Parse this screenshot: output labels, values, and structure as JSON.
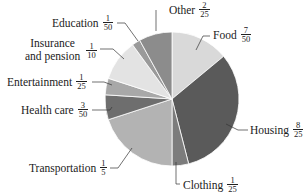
{
  "chart_data": {
    "type": "pie",
    "title": "",
    "start_angle_deg": 0,
    "direction": "clockwise",
    "slices": [
      {
        "label": "Food",
        "fraction": "7/50",
        "value": 0.14,
        "color": "#d9d9d9"
      },
      {
        "label": "Housing",
        "fraction": "8/25",
        "value": 0.32,
        "color": "#5a5a5a"
      },
      {
        "label": "Clothing",
        "fraction": "1/25",
        "value": 0.04,
        "color": "#7c7c7c"
      },
      {
        "label": "Transportation",
        "fraction": "1/5",
        "value": 0.2,
        "color": "#b3b3b3"
      },
      {
        "label": "Health care",
        "fraction": "3/50",
        "value": 0.06,
        "color": "#6e6e6e"
      },
      {
        "label": "Entertainment",
        "fraction": "1/25",
        "value": 0.04,
        "color": "#a8a8a8"
      },
      {
        "label": "Insurance and pension",
        "fraction": "1/10",
        "value": 0.1,
        "color": "#e3e3e3"
      },
      {
        "label": "Education",
        "fraction": "1/50",
        "value": 0.02,
        "color": "#9a9a9a"
      },
      {
        "label": "Other",
        "fraction": "2/25",
        "value": 0.08,
        "color": "#8c8c8c"
      }
    ],
    "legend": "callout labels with leader lines"
  },
  "labels": {
    "food": {
      "name": "Food",
      "num": "7",
      "den": "50"
    },
    "housing": {
      "name": "Housing",
      "num": "8",
      "den": "25"
    },
    "clothing": {
      "name": "Clothing",
      "num": "1",
      "den": "25"
    },
    "transportation": {
      "name": "Transportation",
      "num": "1",
      "den": "5"
    },
    "health": {
      "name": "Health care",
      "num": "3",
      "den": "50"
    },
    "entertainment": {
      "name": "Entertainment",
      "num": "1",
      "den": "25"
    },
    "insurance": {
      "name_line1": "Insurance",
      "name_line2": "and pension",
      "num": "1",
      "den": "10"
    },
    "education": {
      "name": "Education",
      "num": "1",
      "den": "50"
    },
    "other": {
      "name": "Other",
      "num": "2",
      "den": "25"
    }
  }
}
